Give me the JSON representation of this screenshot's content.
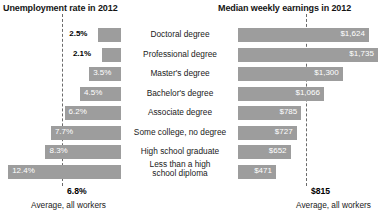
{
  "panels": {
    "left_title": "Unemployment rate in 2012",
    "right_title": "Median weekly earnings in 2012"
  },
  "average": {
    "left_value": "6.8%",
    "left_caption": "Average, all workers",
    "right_value": "$815",
    "right_caption": "Average, all workers"
  },
  "rows": [
    {
      "category": "Doctoral degree",
      "unemployment_label": "2.5%",
      "earnings_label": "$1,624"
    },
    {
      "category": "Professional degree",
      "unemployment_label": "2.1%",
      "earnings_label": "$1,735"
    },
    {
      "category": "Master's degree",
      "unemployment_label": "3.5%",
      "earnings_label": "$1,300"
    },
    {
      "category": "Bachelor's degree",
      "unemployment_label": "4.5%",
      "earnings_label": "$1,066"
    },
    {
      "category": "Associate degree",
      "unemployment_label": "6.2%",
      "earnings_label": "$785"
    },
    {
      "category": "Some college, no degree",
      "unemployment_label": "7.7%",
      "earnings_label": "$727"
    },
    {
      "category": "High school graduate",
      "unemployment_label": "8.3%",
      "earnings_label": "$652"
    },
    {
      "category": "Less than a high\nschool diploma",
      "unemployment_label": "12.4%",
      "earnings_label": "$471"
    }
  ],
  "chart_data": {
    "type": "bar",
    "layout": "butterfly",
    "categories": [
      "Doctoral degree",
      "Professional degree",
      "Master's degree",
      "Bachelor's degree",
      "Associate degree",
      "Some college, no degree",
      "High school graduate",
      "Less than a high school diploma"
    ],
    "series": [
      {
        "name": "Unemployment rate in 2012",
        "unit": "percent",
        "direction": "left",
        "values": [
          2.5,
          2.1,
          3.5,
          4.5,
          6.2,
          7.7,
          8.3,
          12.4
        ],
        "axis_max": 12.4,
        "reference_line": 6.8,
        "reference_label": "Average, all workers"
      },
      {
        "name": "Median weekly earnings in 2012",
        "unit": "US dollars",
        "direction": "right",
        "values": [
          1624,
          1735,
          1300,
          1066,
          785,
          727,
          652,
          471
        ],
        "axis_max": 1735,
        "reference_line": 815,
        "reference_label": "Average, all workers"
      }
    ],
    "xlabel": "",
    "ylabel": "",
    "grid": false,
    "legend": "none"
  }
}
